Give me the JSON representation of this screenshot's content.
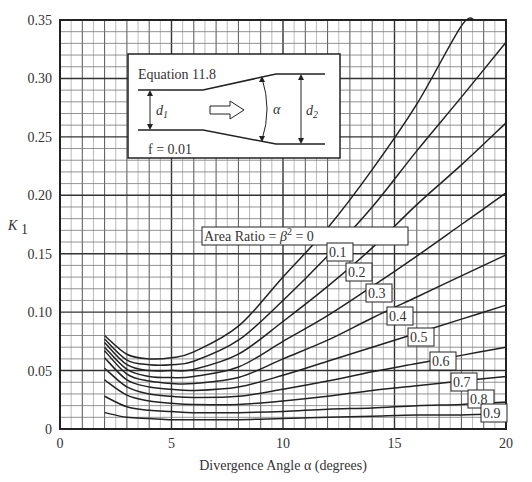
{
  "chart_data": {
    "type": "line",
    "title": "",
    "xlabel": "Divergence Angle α (degrees)",
    "ylabel": "K1",
    "xlim": [
      0,
      20
    ],
    "ylim": [
      0,
      0.35
    ],
    "x_ticks": [
      0,
      5,
      10,
      15,
      20
    ],
    "y_ticks": [
      "0",
      "0.05",
      "0.10",
      "0.15",
      "0.20",
      "0.25",
      "0.30",
      "0.35"
    ],
    "grid": true,
    "x": [
      2,
      3,
      4,
      5,
      6,
      8,
      10,
      12,
      14,
      16,
      18,
      20
    ],
    "series": [
      {
        "name": "0",
        "label": "Area Ratio = β² = 0",
        "values": [
          0.08,
          0.064,
          0.06,
          0.061,
          0.066,
          0.088,
          0.13,
          0.172,
          0.222,
          0.278,
          0.345,
          null
        ]
      },
      {
        "name": "0.1",
        "label": "0.1",
        "values": [
          0.077,
          0.059,
          0.055,
          0.055,
          0.058,
          0.076,
          0.11,
          0.148,
          0.19,
          0.238,
          0.284,
          0.331
        ]
      },
      {
        "name": "0.2",
        "label": "0.2",
        "values": [
          0.074,
          0.055,
          0.05,
          0.05,
          0.051,
          0.064,
          0.092,
          0.122,
          0.155,
          0.192,
          0.226,
          0.262
        ]
      },
      {
        "name": "0.3",
        "label": "0.3",
        "values": [
          0.07,
          0.051,
          0.045,
          0.044,
          0.045,
          0.053,
          0.075,
          0.097,
          0.122,
          0.148,
          0.175,
          0.202
        ]
      },
      {
        "name": "0.4",
        "label": "0.4",
        "values": [
          0.067,
          0.047,
          0.041,
          0.039,
          0.039,
          0.044,
          0.06,
          0.076,
          0.095,
          0.113,
          0.131,
          0.149
        ]
      },
      {
        "name": "0.5",
        "label": "0.5",
        "values": [
          0.061,
          0.042,
          0.036,
          0.034,
          0.033,
          0.036,
          0.046,
          0.058,
          0.07,
          0.082,
          0.094,
          0.106
        ]
      },
      {
        "name": "0.6",
        "label": "0.6",
        "values": [
          0.052,
          0.036,
          0.03,
          0.028,
          0.027,
          0.028,
          0.034,
          0.041,
          0.049,
          0.056,
          0.063,
          0.07
        ]
      },
      {
        "name": "0.7",
        "label": "0.7",
        "values": [
          0.042,
          0.029,
          0.024,
          0.022,
          0.021,
          0.021,
          0.024,
          0.028,
          0.033,
          0.037,
          0.041,
          0.045
        ]
      },
      {
        "name": "0.8",
        "label": "0.8",
        "values": [
          0.028,
          0.019,
          0.016,
          0.015,
          0.014,
          0.014,
          0.015,
          0.017,
          0.018,
          0.02,
          0.021,
          0.023
        ]
      },
      {
        "name": "0.9",
        "label": "0.9",
        "values": [
          0.014,
          0.01,
          0.009,
          0.008,
          0.008,
          0.008,
          0.009,
          0.01,
          0.011,
          0.012,
          0.012,
          0.013
        ]
      }
    ],
    "series_end": {
      "0": [
        18.6,
        0.35
      ]
    },
    "label_positions": [
      {
        "series": "0",
        "x": 204,
        "y": 241,
        "w": 202
      },
      {
        "series": "0.1",
        "x": 329,
        "y": 257,
        "w": 22
      },
      {
        "series": "0.2",
        "x": 348,
        "y": 277,
        "w": 22
      },
      {
        "series": "0.3",
        "x": 368,
        "y": 298,
        "w": 22
      },
      {
        "series": "0.4",
        "x": 389,
        "y": 321,
        "w": 22
      },
      {
        "series": "0.5",
        "x": 410,
        "y": 342,
        "w": 22
      },
      {
        "series": "0.6",
        "x": 432,
        "y": 366,
        "w": 22
      },
      {
        "series": "0.7",
        "x": 453,
        "y": 387,
        "w": 22
      },
      {
        "series": "0.8",
        "x": 470,
        "y": 404,
        "w": 22
      },
      {
        "series": "0.9",
        "x": 483,
        "y": 418,
        "w": 22
      }
    ],
    "inset": {
      "title": "Equation 11.8",
      "friction": "f = 0.01",
      "labels": {
        "d1": "d",
        "d1_sub": "1",
        "alpha": "α",
        "d2": "d",
        "d2_sub": "2"
      }
    },
    "colors": {
      "line": "#222222",
      "grid_major": "#333333",
      "grid_minor": "#999999",
      "background": "#ffffff"
    }
  }
}
